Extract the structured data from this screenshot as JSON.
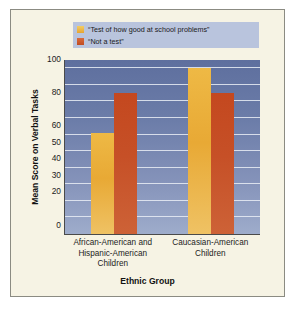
{
  "chart_data": {
    "type": "bar",
    "title": "",
    "xlabel": "Ethnic Group",
    "ylabel": "Mean Score on Verbal Tasks",
    "categories": [
      "African-American and Hispanic-American Children",
      "Caucasian-American Children"
    ],
    "category_lines": [
      [
        "African-American and",
        "Hispanic-American",
        "Children"
      ],
      [
        "Caucasian-American",
        "Children"
      ]
    ],
    "series": [
      {
        "name": "“Test of how good at school problems”",
        "color": "#e8a935",
        "values": [
          61,
          100
        ]
      },
      {
        "name": "“Not a test”",
        "color": "#c4501f",
        "values": [
          85,
          85
        ]
      }
    ],
    "ylim": [
      0,
      105
    ],
    "yticks": [
      0,
      20,
      30,
      40,
      50,
      60,
      80,
      100
    ],
    "ytick_labels": [
      "0",
      "20",
      "30",
      "40",
      "50",
      "60",
      "80",
      "100"
    ],
    "gridlines": [
      10,
      20,
      30,
      40,
      50,
      60,
      70,
      80,
      90,
      100
    ],
    "grid": true,
    "legend_position": "top-center",
    "plot_background": "#6c7da9",
    "figure_background": "#f6f3e4"
  },
  "legend": {
    "entries": [
      {
        "label": "“Test of how good at school problems”",
        "swatch": "legend-swatch-yellow"
      },
      {
        "label": "“Not a test”",
        "swatch": "legend-swatch-orange"
      }
    ]
  }
}
